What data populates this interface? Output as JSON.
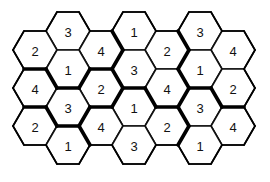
{
  "puzzle": {
    "title": "Hexagonal number grid",
    "geometry": {
      "r": 22,
      "half_height": 19,
      "col_spacing": 33,
      "row_spacing": 38,
      "origin_x": 35,
      "odd_top_y": 31,
      "even_top_y": 50
    },
    "colors": {
      "stroke": "#111111",
      "fill": "#ffffff",
      "text": "#111111"
    },
    "cells": [
      {
        "col": 1,
        "row": 0,
        "value": "3",
        "group": "A"
      },
      {
        "col": 3,
        "row": 0,
        "value": "1",
        "group": "B"
      },
      {
        "col": 5,
        "row": 0,
        "value": "3",
        "group": "C"
      },
      {
        "col": 0,
        "row": 0,
        "value": "2",
        "group": "A"
      },
      {
        "col": 2,
        "row": 0,
        "value": "4",
        "group": "A"
      },
      {
        "col": 4,
        "row": 0,
        "value": "2",
        "group": "B"
      },
      {
        "col": 6,
        "row": 0,
        "value": "4",
        "group": "C"
      },
      {
        "col": 1,
        "row": 1,
        "value": "1",
        "group": "A"
      },
      {
        "col": 3,
        "row": 1,
        "value": "3",
        "group": "B"
      },
      {
        "col": 5,
        "row": 1,
        "value": "1",
        "group": "C"
      },
      {
        "col": 0,
        "row": 1,
        "value": "4",
        "group": "D"
      },
      {
        "col": 2,
        "row": 1,
        "value": "2",
        "group": "D"
      },
      {
        "col": 4,
        "row": 1,
        "value": "4",
        "group": "B"
      },
      {
        "col": 6,
        "row": 1,
        "value": "2",
        "group": "C"
      },
      {
        "col": 1,
        "row": 2,
        "value": "3",
        "group": "D"
      },
      {
        "col": 3,
        "row": 2,
        "value": "1",
        "group": "E"
      },
      {
        "col": 5,
        "row": 2,
        "value": "3",
        "group": "F"
      },
      {
        "col": 0,
        "row": 2,
        "value": "2",
        "group": "G"
      },
      {
        "col": 2,
        "row": 2,
        "value": "4",
        "group": "E"
      },
      {
        "col": 4,
        "row": 2,
        "value": "2",
        "group": "E"
      },
      {
        "col": 6,
        "row": 2,
        "value": "4",
        "group": "F"
      },
      {
        "col": 1,
        "row": 3,
        "value": "1",
        "group": "G"
      },
      {
        "col": 3,
        "row": 3,
        "value": "3",
        "group": "E"
      },
      {
        "col": 5,
        "row": 3,
        "value": "1",
        "group": "F"
      },
      {
        "col": 0,
        "row": 3,
        "value": null,
        "group": null
      }
    ]
  }
}
